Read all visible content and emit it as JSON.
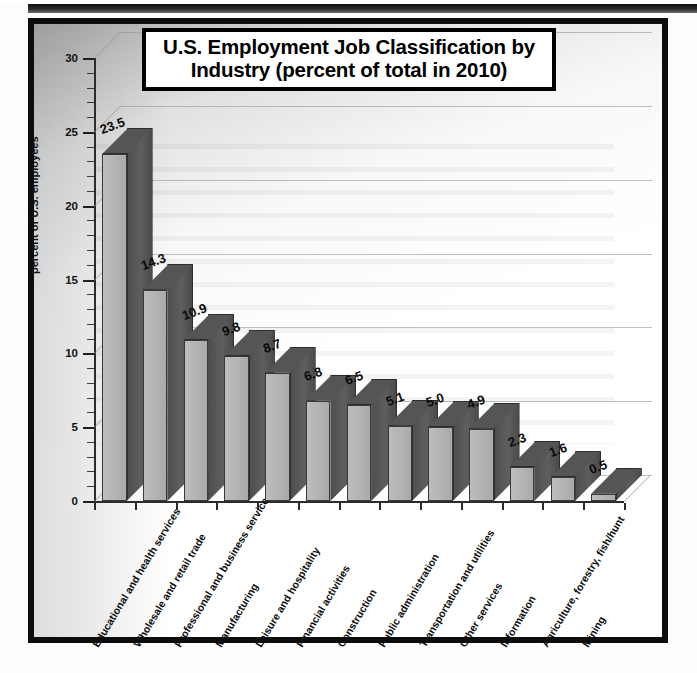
{
  "figure": {
    "title_line1": "U.S. Employment Job Classification by",
    "title_line2": "Industry (percent of total in 2010)"
  },
  "chart_data": {
    "type": "bar",
    "title": "U.S. Employment Job Classification by Industry (percent of total in 2010)",
    "xlabel": "",
    "ylabel": "percent of U.S. employees",
    "ylim": [
      0,
      30
    ],
    "ytick_labels": [
      "0",
      "5",
      "10",
      "15",
      "20",
      "25",
      "30"
    ],
    "ytick_values": [
      0,
      5,
      10,
      15,
      20,
      25,
      30
    ],
    "minor_tick_interval": 1,
    "grid": true,
    "legend": "none",
    "style": "3d-column",
    "categories": [
      "Educational and health services",
      "Wholesale and retail trade",
      "Professional and business services",
      "Manufacturing",
      "Leisure and hospitality",
      "Financial activities",
      "Construction",
      "Public administration",
      "Transportation and utilities",
      "Other services",
      "Information",
      "Agriculture, forestry, fish/hunt",
      "Mining"
    ],
    "values": [
      23.5,
      14.3,
      10.9,
      9.8,
      8.7,
      6.8,
      6.5,
      5.1,
      5.0,
      4.9,
      2.3,
      1.6,
      0.5
    ],
    "value_labels": [
      "23.5",
      "14.3",
      "10.9",
      "9.8",
      "8.7",
      "6.8",
      "6.5",
      "5.1",
      "5.0",
      "4.9",
      "2.3",
      "1.6",
      "0.5"
    ]
  },
  "colors": {
    "bar_front": "#b2b2b2",
    "bar_side": "#555555",
    "bar_top": "#555555",
    "axis": "#2c2c2c",
    "grid": "#9b9b9b",
    "frame": "#0d0d0d",
    "text": "#0a0a0a"
  }
}
